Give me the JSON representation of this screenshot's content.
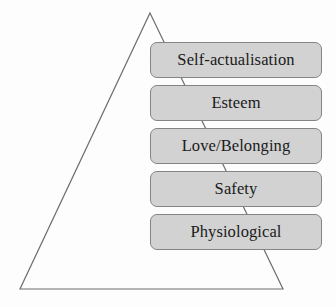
{
  "diagram": {
    "shape": "triangle-outline",
    "colors": {
      "background": "#fdfdfd",
      "box_fill": "#d2d2d2",
      "box_border": "#848484",
      "triangle_stroke": "#6e6e6e",
      "text": "#1a1a1a"
    },
    "triangle": {
      "apex": "150,13",
      "bottom_left": "20,289",
      "bottom_right": "283,289"
    },
    "levels": [
      {
        "label": "Self-actualisation"
      },
      {
        "label": "Esteem"
      },
      {
        "label": "Love/Belonging"
      },
      {
        "label": "Safety"
      },
      {
        "label": "Physiological"
      }
    ]
  }
}
